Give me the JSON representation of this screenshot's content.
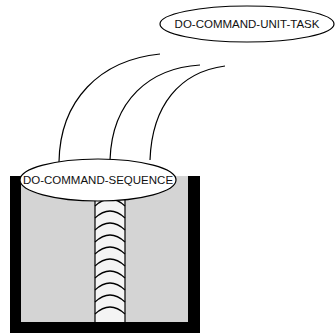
{
  "diagram": {
    "top_node": {
      "label": "DO-COMMAND-UNIT-TASK"
    },
    "middle_node": {
      "label": "DO-COMMAND-SEQUENCE"
    },
    "container": {
      "frame_color": "#000000",
      "fill_color": "#d4d4d4"
    },
    "chain": {
      "segment_count": 10
    },
    "connections": 3
  }
}
